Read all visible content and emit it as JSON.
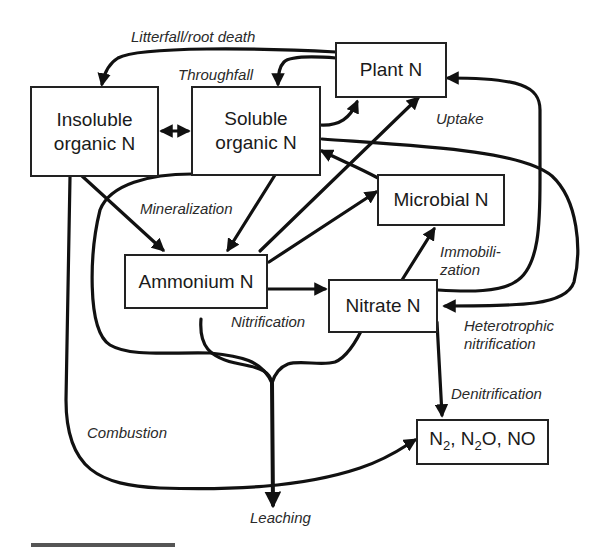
{
  "diagram": {
    "nodes": {
      "plant": {
        "label": "Plant N"
      },
      "insoluble": {
        "label_line1": "Insoluble",
        "label_line2": "organic N"
      },
      "soluble": {
        "label_line1": "Soluble",
        "label_line2": "organic N"
      },
      "microbial": {
        "label": "Microbial N"
      },
      "ammonium": {
        "label": "Ammonium N"
      },
      "nitrate": {
        "label": "Nitrate N"
      },
      "gases": {
        "n": "N",
        "sub2": "2",
        "sep1": ", N",
        "sub2b": "2",
        "rest": "O, NO"
      }
    },
    "flows": {
      "litterfall": "Litterfall/root death",
      "throughfall": "Throughfall",
      "uptake": "Uptake",
      "mineralization": "Mineralization",
      "immobilization_line1": "Immobili-",
      "immobilization_line2": "zation",
      "nitrification": "Nitrification",
      "heterotrophic_line1": "Heterotrophic",
      "heterotrophic_line2": "nitrification",
      "denitrification": "Denitrification",
      "combustion": "Combustion",
      "leaching": "Leaching"
    },
    "colors": {
      "line": "#111111",
      "box_border": "#222222",
      "text": "#1a1a1a"
    }
  }
}
